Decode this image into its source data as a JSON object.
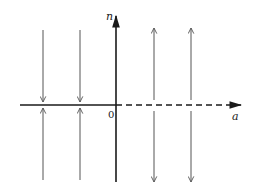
{
  "diagram": {
    "type": "phase-line-diagram",
    "axes": {
      "vertical_label": "n",
      "horizontal_label": "a",
      "origin_label": "0"
    },
    "colors": {
      "axis": "#1a1a1a",
      "flow_line": "#555555",
      "background": "#ffffff"
    },
    "left_half": {
      "axis_style": "solid",
      "flow_direction": "toward-axis",
      "line_count": 2
    },
    "right_half": {
      "axis_style": "dashed",
      "flow_direction": "away-from-axis",
      "line_count": 2
    }
  }
}
